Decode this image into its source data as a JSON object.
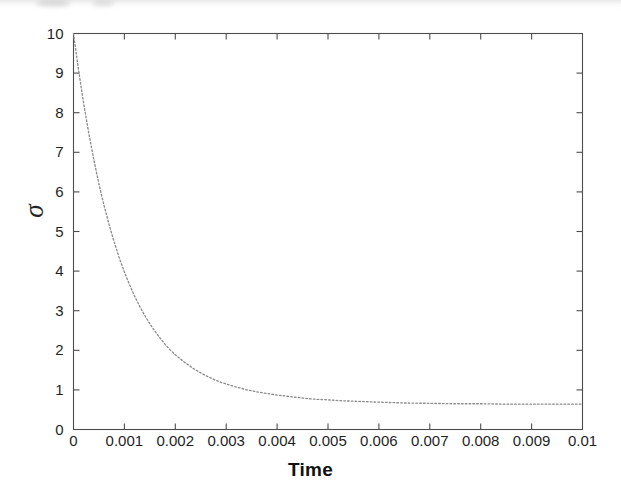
{
  "figure": {
    "background_color": "#ffffff",
    "axis_color": "#4d4d4d",
    "curve_color": "#8c8c8c",
    "text_color": "#1a1a1a"
  },
  "chart_data": {
    "type": "line",
    "title": "",
    "subtitle": "",
    "xlabel": "Time",
    "ylabel": "σ",
    "xlim": [
      0,
      0.01
    ],
    "ylim": [
      0,
      10
    ],
    "grid": false,
    "legend": null,
    "legend_position": "none",
    "line_style": "dotted",
    "box_frame": true,
    "ticks_direction": "in",
    "ticks_all_sides": true,
    "xticks": [
      0,
      0.001,
      0.002,
      0.003,
      0.004,
      0.005,
      0.006,
      0.007,
      0.008,
      0.009,
      0.01
    ],
    "xticklabels": [
      "0",
      "0.001",
      "0.002",
      "0.003",
      "0.004",
      "0.005",
      "0.006",
      "0.007",
      "0.008",
      "0.009",
      "0.01"
    ],
    "yticks": [
      0,
      1,
      2,
      3,
      4,
      5,
      6,
      7,
      8,
      9,
      10
    ],
    "yticklabels": [
      "0",
      "1",
      "2",
      "3",
      "4",
      "5",
      "6",
      "7",
      "8",
      "9",
      "10"
    ],
    "series": [
      {
        "name": "sigma",
        "x": [
          0,
          0.0001,
          0.0002,
          0.0003,
          0.0004,
          0.0005,
          0.0006,
          0.0007,
          0.0008,
          0.0009,
          0.001,
          0.0011,
          0.0012,
          0.0013,
          0.0014,
          0.0015,
          0.0016,
          0.0017,
          0.0018,
          0.0019,
          0.002,
          0.0021,
          0.0022,
          0.0023,
          0.0024,
          0.0025,
          0.0026,
          0.0027,
          0.0028,
          0.0029,
          0.003,
          0.0031,
          0.0032,
          0.0033,
          0.0034,
          0.0035,
          0.0036,
          0.0037,
          0.0038,
          0.0039,
          0.004,
          0.0042,
          0.0044,
          0.0046,
          0.0048,
          0.005,
          0.0052,
          0.0054,
          0.0056,
          0.0058,
          0.006,
          0.0065,
          0.007,
          0.0075,
          0.008,
          0.0085,
          0.009,
          0.0095,
          0.01
        ],
        "y": [
          10.0,
          9.07,
          8.23,
          7.48,
          6.81,
          6.2,
          5.66,
          5.17,
          4.73,
          4.33,
          3.98,
          3.66,
          3.37,
          3.11,
          2.88,
          2.67,
          2.48,
          2.31,
          2.15,
          2.01,
          1.89,
          1.78,
          1.68,
          1.59,
          1.5,
          1.43,
          1.36,
          1.3,
          1.24,
          1.19,
          1.15,
          1.11,
          1.07,
          1.04,
          1.0,
          0.98,
          0.95,
          0.93,
          0.91,
          0.89,
          0.87,
          0.84,
          0.81,
          0.78,
          0.76,
          0.75,
          0.73,
          0.72,
          0.71,
          0.7,
          0.69,
          0.67,
          0.66,
          0.65,
          0.65,
          0.64,
          0.64,
          0.64,
          0.64
        ]
      }
    ],
    "annotations": []
  }
}
